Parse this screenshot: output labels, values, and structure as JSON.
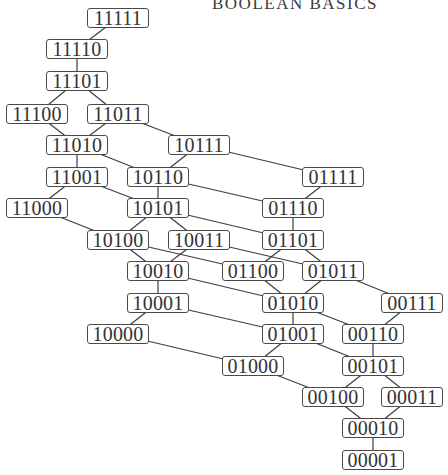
{
  "title": "BOOLEAN BASICS",
  "colors": {
    "background": "#ffffff",
    "edge": "#3d3d3d",
    "node_border": "#4a4a4a",
    "text": "#333333"
  },
  "nodes": [
    {
      "id": "11111",
      "label": "11111",
      "cx": 118,
      "cy": 18
    },
    {
      "id": "11110",
      "label": "11110",
      "cx": 77,
      "cy": 49
    },
    {
      "id": "11101",
      "label": "11101",
      "cx": 77,
      "cy": 81
    },
    {
      "id": "11100",
      "label": "11100",
      "cx": 37,
      "cy": 114
    },
    {
      "id": "11011",
      "label": "11011",
      "cx": 118,
      "cy": 114
    },
    {
      "id": "11010",
      "label": "11010",
      "cx": 77,
      "cy": 145
    },
    {
      "id": "10111",
      "label": "10111",
      "cx": 199,
      "cy": 145
    },
    {
      "id": "11001",
      "label": "11001",
      "cx": 77,
      "cy": 177
    },
    {
      "id": "10110",
      "label": "10110",
      "cx": 158,
      "cy": 177
    },
    {
      "id": "01111",
      "label": "01111",
      "cx": 333,
      "cy": 177
    },
    {
      "id": "11000",
      "label": "11000",
      "cx": 37,
      "cy": 208
    },
    {
      "id": "10101",
      "label": "10101",
      "cx": 158,
      "cy": 208
    },
    {
      "id": "01110",
      "label": "01110",
      "cx": 293,
      "cy": 208
    },
    {
      "id": "10100",
      "label": "10100",
      "cx": 118,
      "cy": 240
    },
    {
      "id": "10011",
      "label": "10011",
      "cx": 199,
      "cy": 240
    },
    {
      "id": "01101",
      "label": "01101",
      "cx": 293,
      "cy": 240
    },
    {
      "id": "10010",
      "label": "10010",
      "cx": 158,
      "cy": 271
    },
    {
      "id": "01100",
      "label": "01100",
      "cx": 253,
      "cy": 271
    },
    {
      "id": "01011",
      "label": "01011",
      "cx": 333,
      "cy": 271
    },
    {
      "id": "10001",
      "label": "10001",
      "cx": 158,
      "cy": 303
    },
    {
      "id": "01010",
      "label": "01010",
      "cx": 293,
      "cy": 303
    },
    {
      "id": "00111",
      "label": "00111",
      "cx": 412,
      "cy": 303
    },
    {
      "id": "10000",
      "label": "10000",
      "cx": 118,
      "cy": 334
    },
    {
      "id": "01001",
      "label": "01001",
      "cx": 293,
      "cy": 334
    },
    {
      "id": "00110",
      "label": "00110",
      "cx": 373,
      "cy": 334
    },
    {
      "id": "01000",
      "label": "01000",
      "cx": 253,
      "cy": 366
    },
    {
      "id": "00101",
      "label": "00101",
      "cx": 373,
      "cy": 366
    },
    {
      "id": "00100",
      "label": "00100",
      "cx": 333,
      "cy": 397
    },
    {
      "id": "00011",
      "label": "00011",
      "cx": 412,
      "cy": 397
    },
    {
      "id": "00010",
      "label": "00010",
      "cx": 373,
      "cy": 428
    },
    {
      "id": "00001",
      "label": "00001",
      "cx": 373,
      "cy": 460
    }
  ],
  "edges": [
    [
      "11111",
      "11110"
    ],
    [
      "11110",
      "11101"
    ],
    [
      "11101",
      "11100"
    ],
    [
      "11101",
      "11011"
    ],
    [
      "11100",
      "11010"
    ],
    [
      "11011",
      "11010"
    ],
    [
      "11011",
      "10111"
    ],
    [
      "11010",
      "11001"
    ],
    [
      "11010",
      "10110"
    ],
    [
      "10111",
      "10110"
    ],
    [
      "10111",
      "01111"
    ],
    [
      "11001",
      "11000"
    ],
    [
      "11001",
      "10101"
    ],
    [
      "10110",
      "10101"
    ],
    [
      "10110",
      "01110"
    ],
    [
      "01111",
      "01110"
    ],
    [
      "11000",
      "10100"
    ],
    [
      "10101",
      "10100"
    ],
    [
      "10101",
      "10011"
    ],
    [
      "10101",
      "01101"
    ],
    [
      "01110",
      "01101"
    ],
    [
      "10100",
      "10010"
    ],
    [
      "10100",
      "01100"
    ],
    [
      "10011",
      "10010"
    ],
    [
      "10011",
      "01011"
    ],
    [
      "01101",
      "01100"
    ],
    [
      "01101",
      "01011"
    ],
    [
      "10010",
      "10001"
    ],
    [
      "10010",
      "01010"
    ],
    [
      "01100",
      "01010"
    ],
    [
      "01011",
      "01010"
    ],
    [
      "01011",
      "00111"
    ],
    [
      "10001",
      "10000"
    ],
    [
      "10001",
      "01001"
    ],
    [
      "01010",
      "01001"
    ],
    [
      "01010",
      "00110"
    ],
    [
      "00111",
      "00110"
    ],
    [
      "10000",
      "01000"
    ],
    [
      "01001",
      "01000"
    ],
    [
      "01001",
      "00101"
    ],
    [
      "00110",
      "00101"
    ],
    [
      "01000",
      "00100"
    ],
    [
      "00101",
      "00100"
    ],
    [
      "00101",
      "00011"
    ],
    [
      "00100",
      "00010"
    ],
    [
      "00011",
      "00010"
    ],
    [
      "00010",
      "00001"
    ]
  ]
}
